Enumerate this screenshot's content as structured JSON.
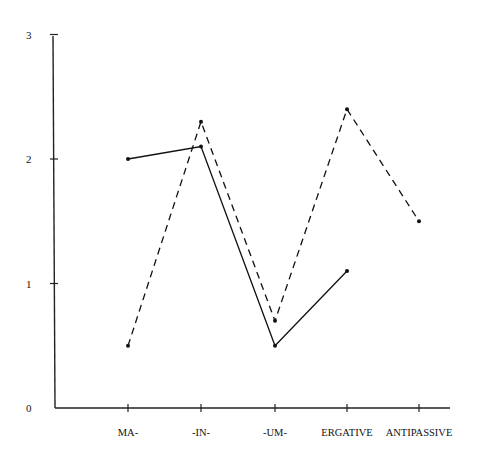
{
  "chart_data": {
    "type": "line",
    "title": "",
    "xlabel": "",
    "ylabel": "",
    "categories": [
      "MA-",
      "-IN-",
      "-UM-",
      "ERGATIVE",
      "ANTIPASSIVE"
    ],
    "yticks": [
      "0",
      "1",
      "2",
      "3"
    ],
    "ylim": [
      0,
      3
    ],
    "grid": false,
    "legend": null,
    "series": [
      {
        "name": "solid",
        "style": "solid",
        "values": [
          2.0,
          2.1,
          0.5,
          1.1,
          null
        ]
      },
      {
        "name": "dashed",
        "style": "dashed",
        "values": [
          0.5,
          2.3,
          0.7,
          2.4,
          1.5
        ]
      }
    ]
  }
}
